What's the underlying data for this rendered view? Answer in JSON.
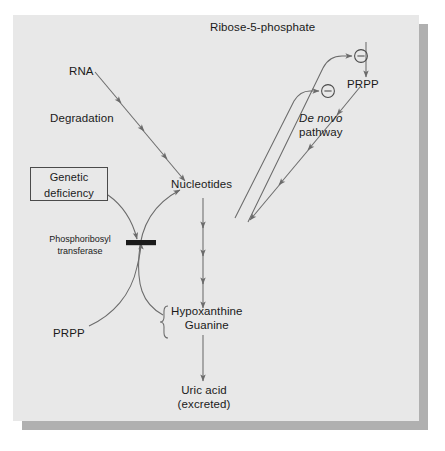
{
  "figure": {
    "kind": "biochemical-pathway-diagram",
    "panel_background": "#e8e8e8",
    "shadow_color": "#b0b0b0",
    "line_color": "#6b6b6b",
    "text_color": "#1a1a1a",
    "block_bar_color": "#1a1a1a"
  },
  "nodes": {
    "ribose5phosphate": {
      "label": "Ribose-5-phosphate"
    },
    "prpp_top": {
      "label": "PRPP"
    },
    "rna": {
      "label": "RNA"
    },
    "degradation": {
      "label": "Degradation"
    },
    "de_novo": {
      "label_italic": "De novo",
      "label_plain": "pathway"
    },
    "nucleotides": {
      "label": "Nucleotides"
    },
    "genetic_deficiency": {
      "line1": "Genetic",
      "line2": "deficiency"
    },
    "phosphoribosyl_transferase": {
      "line1": "Phosphoribosyl",
      "line2": "transferase"
    },
    "prpp_bottom": {
      "label": "PRPP"
    },
    "bases": {
      "line1": "Hypoxanthine",
      "line2": "Guanine"
    },
    "uric_acid": {
      "line1": "Uric acid",
      "line2": "(excreted)"
    }
  },
  "symbols": {
    "inhibition_upper": {
      "glyph": "⊖",
      "meaning": "negative feedback inhibition"
    },
    "inhibition_lower": {
      "glyph": "⊖",
      "meaning": "negative feedback inhibition"
    },
    "enzyme_block": {
      "meaning": "enzymatic block due to genetic deficiency"
    },
    "brace_bases": {
      "glyph": "{",
      "meaning": "groups Hypoxanthine and Guanine"
    }
  },
  "edges": [
    {
      "from": "rna",
      "to": "nucleotides",
      "style": "multi-arrowhead",
      "label": "Degradation"
    },
    {
      "from": "ribose5phosphate",
      "to": "prpp_top",
      "style": "arrow"
    },
    {
      "from": "prpp_top",
      "to": "nucleotides",
      "style": "multi-arrowhead",
      "label": "De novo pathway"
    },
    {
      "from": "nucleotides",
      "to": "inhibition_upper",
      "style": "feedback-curve"
    },
    {
      "from": "nucleotides",
      "to": "inhibition_lower",
      "style": "feedback-curve"
    },
    {
      "from": "nucleotides",
      "to": "bases",
      "style": "multi-arrowhead"
    },
    {
      "from": "bases",
      "to": "uric_acid",
      "style": "arrow"
    },
    {
      "from": "bases",
      "to": "nucleotides",
      "style": "salvage-curve"
    },
    {
      "from": "prpp_bottom",
      "to": "nucleotides",
      "style": "salvage-curve"
    },
    {
      "from": "genetic_deficiency",
      "to": "enzyme_block",
      "style": "curve-arrow"
    }
  ]
}
